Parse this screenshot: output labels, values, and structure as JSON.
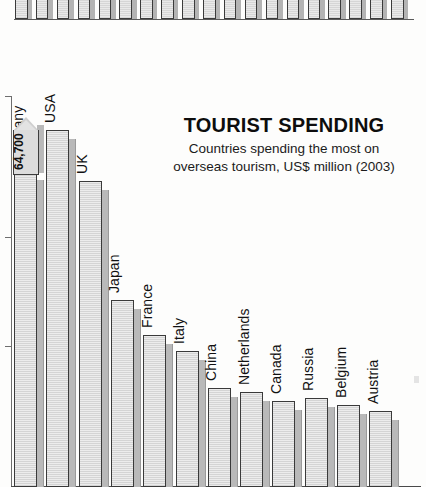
{
  "title": "TOURIST SPENDING",
  "subtitle_line1": "Countries spending the most on",
  "subtitle_line2": "overseas tourism, US$ million (2003)",
  "callout": {
    "value_label": "64,700",
    "country": "Germany"
  },
  "labels": {
    "germany": "Germany",
    "usa": "USA",
    "uk": "UK",
    "japan": "Japan",
    "france": "France",
    "italy": "Italy",
    "china": "China",
    "netherlands": "Netherlands",
    "canada": "Canada",
    "russia": "Russia",
    "belgium": "Belgium",
    "austria": "Austria"
  },
  "colors": {
    "bar_fill": "#e4e4e4",
    "bar_outline": "#3a3a3a",
    "bar_shadow": "#b9b9b9",
    "axis": "#6e6e6e",
    "text": "#111111",
    "background": "#fdfdfc"
  },
  "chart_data": {
    "type": "bar",
    "title": "TOURIST SPENDING",
    "subtitle": "Countries spending the most on overseas tourism, US$ million (2003)",
    "xlabel": "",
    "ylabel": "US$ million",
    "unit": "US$ million",
    "year": 2003,
    "grid": false,
    "legend": false,
    "orientation": "vertical",
    "ylim": [
      0,
      72000
    ],
    "axis_ticks_visible": 3,
    "labeled_points": [
      {
        "category": "Germany",
        "value": 64700,
        "label": "64,700"
      }
    ],
    "categories": [
      "Germany",
      "USA",
      "UK",
      "Japan",
      "France",
      "Italy",
      "China",
      "Netherlands",
      "Canada",
      "Russia",
      "Belgium",
      "Austria"
    ],
    "values": [
      64700,
      65400,
      48700,
      28800,
      19500,
      16100,
      12200,
      11600,
      10400,
      10800,
      9700,
      9000
    ]
  },
  "top_fragment": {
    "description": "cut-off bar chart fragment from the page above",
    "bar_count": 19
  }
}
